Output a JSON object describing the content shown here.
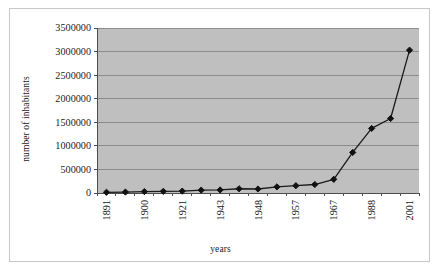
{
  "chart_data": {
    "type": "line",
    "title": "",
    "xlabel": "years",
    "ylabel": "number of inhabitants",
    "ylim": [
      0,
      3500000
    ],
    "ytick_values": [
      0,
      500000,
      1000000,
      1500000,
      2000000,
      2500000,
      3000000,
      3500000
    ],
    "ytick_labels": [
      "0",
      "500000",
      "1000000",
      "1500000",
      "2000000",
      "2500000",
      "3000000",
      "3500000"
    ],
    "grid": true,
    "legend": false,
    "categories": [
      "1891",
      "",
      "1900",
      "",
      "1921",
      "",
      "1943",
      "",
      "1948",
      "",
      "1957",
      "",
      "1967",
      "",
      "1988",
      "",
      "2001"
    ],
    "xtick_labels": [
      "1891",
      "1900",
      "1921",
      "1943",
      "1948",
      "1957",
      "1967",
      "1988",
      "2001"
    ],
    "values": [
      15000,
      20000,
      30000,
      35000,
      40000,
      60000,
      65000,
      90000,
      85000,
      130000,
      155000,
      180000,
      290000,
      860000,
      1370000,
      1580000,
      3030000
    ],
    "marker": "diamond",
    "line_color": "#1a1a1a",
    "plot_background": "#bfbfbf",
    "gridline_color": "#8c8c8c"
  },
  "colors": {
    "plot_bg": "#bfbfbf",
    "grid": "#8c8c8c",
    "line": "#1a1a1a",
    "marker": "#111111",
    "axis": "#4d4d4d",
    "frame": "#c8c8c8",
    "text": "#1a1a1a"
  }
}
